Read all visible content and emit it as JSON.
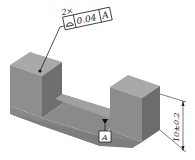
{
  "drawing": {
    "multiplier": "2×",
    "fcf": {
      "symbol": "profile-of-surface",
      "tolerance": "0.04",
      "datum": "A"
    },
    "datum_label": "A",
    "dimension": "10±0.2"
  },
  "colors": {
    "top_face": "#a8a8a8",
    "front_face": "#8c8c8c",
    "side_face": "#6e6e6e",
    "line": "#222222"
  }
}
